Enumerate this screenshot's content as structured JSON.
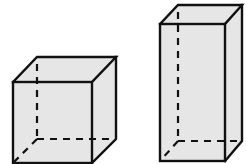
{
  "diagram": {
    "type": "geometry",
    "colors": {
      "face_fill": "#e6e6e6",
      "edge": "#111111",
      "background": "#ffffff"
    },
    "shapes": [
      {
        "name": "cube",
        "front": {
          "x1": 13,
          "y1": 82,
          "x2": 92,
          "y2": 163
        },
        "back": {
          "x1": 37,
          "y1": 57,
          "x2": 116,
          "y2": 139
        }
      },
      {
        "name": "tall-rectangular-prism",
        "front": {
          "x1": 160,
          "y1": 24,
          "x2": 225,
          "y2": 161
        },
        "back": {
          "x1": 178,
          "y1": 5,
          "x2": 242,
          "y2": 141
        }
      }
    ]
  }
}
